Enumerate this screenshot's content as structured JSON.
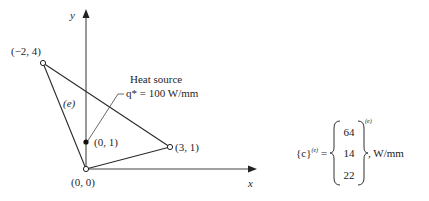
{
  "diagram": {
    "axes": {
      "x_label": "x",
      "y_label": "y"
    },
    "element_label": "(e)",
    "nodes": [
      {
        "id": "node-origin",
        "label": "(0, 0)",
        "x": 0,
        "y": 0,
        "marker": "open-circle"
      },
      {
        "id": "node-3-1",
        "label": "(3, 1)",
        "x": 3,
        "y": 1,
        "marker": "open-circle"
      },
      {
        "id": "node-neg2-4",
        "label": "(−2, 4)",
        "x": -2,
        "y": 4,
        "marker": "open-circle"
      }
    ],
    "heat_source": {
      "point_label": "(0, 1)",
      "x": 0,
      "y": 1,
      "marker": "filled-circle",
      "title": "Heat source",
      "value_text": "q* = 100 W/mm",
      "symbol": "q*",
      "value": 100,
      "unit": "W/mm"
    },
    "triangle_edges": [
      [
        "(0, 0)",
        "(3, 1)"
      ],
      [
        "(3, 1)",
        "(−2, 4)"
      ],
      [
        "(−2, 4)",
        "(0, 0)"
      ]
    ]
  },
  "equation": {
    "lhs": "{c}",
    "lhs_superscript": "(e)",
    "equals": "=",
    "vector": [
      "64",
      "14",
      "22"
    ],
    "vector_superscript": "(e)",
    "unit": ", W/mm"
  },
  "colors": {
    "line": "#2a2a2a",
    "axis": "#333333",
    "background": "#ffffff"
  }
}
